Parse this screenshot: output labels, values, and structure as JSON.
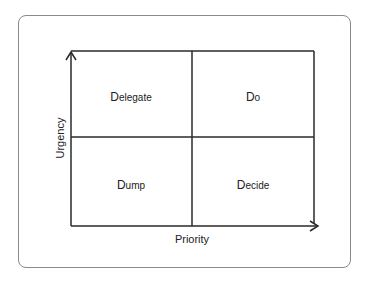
{
  "diagram": {
    "type": "quadrant-matrix",
    "x_axis": {
      "label": "Priority"
    },
    "y_axis": {
      "label": "Urgency"
    },
    "quadrants": [
      {
        "position": "top-left",
        "first": "D",
        "rest": "elegate",
        "label": "Delegate"
      },
      {
        "position": "top-right",
        "first": "D",
        "rest": "o",
        "label": "Do"
      },
      {
        "position": "bottom-left",
        "first": "D",
        "rest": "ump",
        "label": "Dump"
      },
      {
        "position": "bottom-right",
        "first": "D",
        "rest": "ecide",
        "label": "Decide"
      }
    ],
    "colors": {
      "line": "#2a2a2a",
      "frame": "#8a8a8a",
      "text": "#222222"
    }
  }
}
